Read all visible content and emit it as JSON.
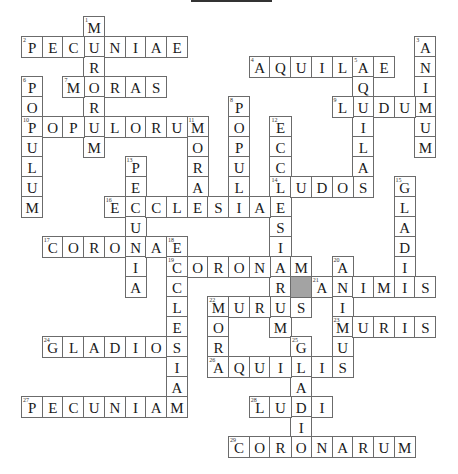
{
  "title": "",
  "grid": {
    "origin_x": 21,
    "origin_y": 16,
    "cell_w": 20.7,
    "cell_h": 20,
    "rows": 22,
    "cols": 20,
    "shaded_color": "#a3a3a3",
    "border_color": "#6b6b6b"
  },
  "shaded_cells": [
    {
      "row": 13,
      "col": 13
    }
  ],
  "words": [
    {
      "number": 1,
      "direction": "down",
      "row": 0,
      "col": 3,
      "answer": "MURORUM"
    },
    {
      "number": 2,
      "direction": "across",
      "row": 1,
      "col": 0,
      "answer": "PECUNIAE"
    },
    {
      "number": 3,
      "direction": "down",
      "row": 1,
      "col": 19,
      "answer": "ANIMUM"
    },
    {
      "number": 4,
      "direction": "across",
      "row": 2,
      "col": 11,
      "answer": "AQUILAE"
    },
    {
      "number": 5,
      "direction": "down",
      "row": 2,
      "col": 16,
      "answer": "AQUILAS"
    },
    {
      "number": 6,
      "direction": "down",
      "row": 3,
      "col": 0,
      "answer": "POPULUM"
    },
    {
      "number": 7,
      "direction": "across",
      "row": 3,
      "col": 2,
      "answer": "MORAS"
    },
    {
      "number": 8,
      "direction": "down",
      "row": 4,
      "col": 10,
      "answer": "POPULI"
    },
    {
      "number": 9,
      "direction": "across",
      "row": 4,
      "col": 15,
      "answer": "LUDUM"
    },
    {
      "number": 10,
      "direction": "across",
      "row": 5,
      "col": 0,
      "answer": "POPULORUM"
    },
    {
      "number": 11,
      "direction": "down",
      "row": 5,
      "col": 8,
      "answer": "MORAE"
    },
    {
      "number": 12,
      "direction": "down",
      "row": 5,
      "col": 12,
      "answer": "ECCLESIARUM"
    },
    {
      "number": 13,
      "direction": "down",
      "row": 7,
      "col": 5,
      "answer": "PECUNIA"
    },
    {
      "number": 14,
      "direction": "across",
      "row": 8,
      "col": 12,
      "answer": "LUDOS"
    },
    {
      "number": 15,
      "direction": "down",
      "row": 8,
      "col": 18,
      "answer": "GLADII"
    },
    {
      "number": 16,
      "direction": "across",
      "row": 9,
      "col": 4,
      "answer": "ECCLESIAE"
    },
    {
      "number": 17,
      "direction": "across",
      "row": 11,
      "col": 1,
      "answer": "CORONAE"
    },
    {
      "number": 18,
      "direction": "down",
      "row": 11,
      "col": 7,
      "answer": "ECCLESIAM"
    },
    {
      "number": 19,
      "direction": "across",
      "row": 12,
      "col": 7,
      "answer": "CORONAM"
    },
    {
      "number": 20,
      "direction": "down",
      "row": 12,
      "col": 15,
      "answer": "ANIMUS"
    },
    {
      "number": 21,
      "direction": "across",
      "row": 13,
      "col": 14,
      "answer": "ANIMIS"
    },
    {
      "number": 22,
      "direction": "across",
      "row": 14,
      "col": 9,
      "answer": "MURUS"
    },
    {
      "number": 22,
      "direction": "down",
      "row": 14,
      "col": 9,
      "answer": "MORA"
    },
    {
      "number": 23,
      "direction": "across",
      "row": 15,
      "col": 15,
      "answer": "MURIS"
    },
    {
      "number": 24,
      "direction": "across",
      "row": 16,
      "col": 1,
      "answer": "GLADIOS"
    },
    {
      "number": 25,
      "direction": "down",
      "row": 16,
      "col": 13,
      "answer": "GLADIO"
    },
    {
      "number": 26,
      "direction": "across",
      "row": 17,
      "col": 9,
      "answer": "AQUILIS"
    },
    {
      "number": 27,
      "direction": "across",
      "row": 19,
      "col": 0,
      "answer": "PECUNIAM"
    },
    {
      "number": 28,
      "direction": "across",
      "row": 19,
      "col": 11,
      "answer": "LUDI"
    },
    {
      "number": 29,
      "direction": "across",
      "row": 21,
      "col": 10,
      "answer": "CORONARUM"
    }
  ]
}
